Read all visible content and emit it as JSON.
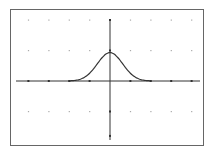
{
  "chart_data": {
    "type": "line",
    "title": "",
    "xlabel": "",
    "ylabel": "",
    "function": "normal distribution curve (bell curve) centered at x=0",
    "xlim": [
      -4,
      5
    ],
    "ylim": [
      -2,
      2
    ],
    "x_tick_step": 1,
    "y_tick_step": 1,
    "grid": "dots",
    "legend": "none",
    "series": [
      {
        "name": "y1",
        "x": [
          -2,
          -1.5,
          -1,
          -0.5,
          0,
          0.5,
          1,
          1.5,
          2
        ],
        "values": [
          0.02,
          0.16,
          0.45,
          0.8,
          0.93,
          0.8,
          0.45,
          0.16,
          0.02
        ]
      }
    ]
  },
  "colors": {
    "background": "#ffffff",
    "frame": "#555555",
    "axes": "#333333",
    "curve": "#333333",
    "grid_dots": "#aaaaaa"
  }
}
